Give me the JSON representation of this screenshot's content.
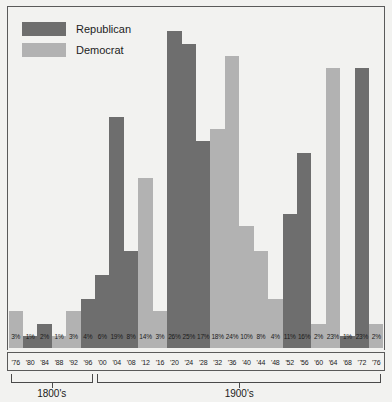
{
  "legend": {
    "items": [
      {
        "label": "Republican",
        "color": "#6e6e6e",
        "key": "republican"
      },
      {
        "label": "Democrat",
        "color": "#b2b2b2",
        "key": "democrat"
      }
    ]
  },
  "axis": {
    "eras": [
      {
        "label": "1800's",
        "start_index": 0,
        "end_index": 5
      },
      {
        "label": "1900's",
        "start_index": 6,
        "end_index": 25
      }
    ]
  },
  "chart_data": {
    "type": "bar",
    "title": "",
    "xlabel": "",
    "ylabel": "",
    "grid": false,
    "legend_position": "top-left",
    "ylim": [
      0,
      28
    ],
    "categories": [
      "'76",
      "'80",
      "'84",
      "'88",
      "'92",
      "'96",
      "'00",
      "'04",
      "'08",
      "'12",
      "'16",
      "'20",
      "'24",
      "'28",
      "'32",
      "'36",
      "'40",
      "'44",
      "'48",
      "'52",
      "'56",
      "'60",
      "'64",
      "'68",
      "'72",
      "'76"
    ],
    "values": [
      3,
      1,
      2,
      1,
      3,
      4,
      6,
      19,
      8,
      14,
      3,
      26,
      25,
      17,
      18,
      24,
      10,
      8,
      4,
      11,
      16,
      2,
      23,
      1,
      23,
      2
    ],
    "value_labels": [
      "3%",
      "1%",
      "2%",
      "1%",
      "3%",
      "4%",
      "6%",
      "19%",
      "8%",
      "14%",
      "3%",
      "26%",
      "25%",
      "17%",
      "18%",
      "24%",
      "10%",
      "8%",
      "4%",
      "11%",
      "16%",
      "2%",
      "23%",
      "1%",
      "23%",
      "2%"
    ],
    "party": [
      "democrat",
      "republican",
      "republican",
      "democrat",
      "democrat",
      "republican",
      "republican",
      "republican",
      "republican",
      "democrat",
      "democrat",
      "republican",
      "republican",
      "republican",
      "democrat",
      "democrat",
      "democrat",
      "democrat",
      "democrat",
      "republican",
      "republican",
      "democrat",
      "democrat",
      "republican",
      "republican",
      "democrat"
    ],
    "series": [
      {
        "name": "Republican",
        "color": "#6e6e6e",
        "values": [
          null,
          1,
          2,
          null,
          null,
          4,
          6,
          19,
          8,
          null,
          null,
          26,
          25,
          17,
          null,
          null,
          null,
          null,
          null,
          11,
          16,
          null,
          null,
          1,
          23,
          null
        ]
      },
      {
        "name": "Democrat",
        "color": "#b2b2b2",
        "values": [
          3,
          null,
          null,
          1,
          3,
          null,
          null,
          null,
          null,
          14,
          3,
          null,
          null,
          null,
          18,
          24,
          10,
          8,
          4,
          null,
          null,
          2,
          23,
          null,
          null,
          2
        ]
      }
    ]
  }
}
